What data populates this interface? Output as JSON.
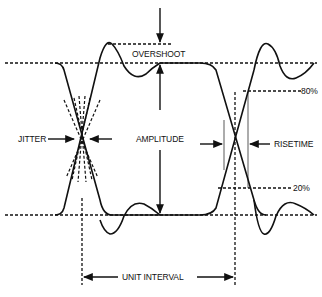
{
  "diagram": {
    "type": "eye-diagram",
    "labels": {
      "overshoot": "OVERSHOOT",
      "jitter": "JITTER",
      "amplitude": "AMPLITUDE",
      "risetime": "RISETIME",
      "pct80": "80%",
      "pct20": "20%",
      "unit_interval": "UNIT INTERVAL"
    },
    "colors": {
      "stroke": "#111111",
      "background": "#ffffff"
    }
  }
}
